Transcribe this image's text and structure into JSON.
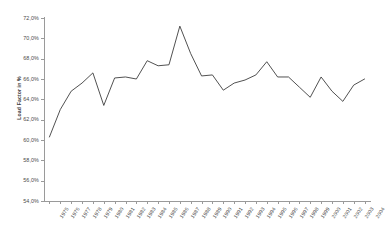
{
  "chart_data": {
    "type": "line",
    "title": "",
    "subtitle": "",
    "xlabel": "",
    "ylabel": "Load Factor in %",
    "ylim": [
      54.0,
      72.0
    ],
    "ytick_step": 2.0,
    "ytick_labels": [
      "72,0%",
      "70,0%",
      "68,0%",
      "66,0%",
      "64,0%",
      "62,0%",
      "60,0%",
      "58,0%",
      "56,0%",
      "54,0%"
    ],
    "ytick_values": [
      72.0,
      70.0,
      68.0,
      66.0,
      64.0,
      62.0,
      60.0,
      58.0,
      56.0,
      54.0
    ],
    "grid": false,
    "legend": false,
    "legend_position": "none",
    "line_color": "#3d3d3d",
    "axis_color": "#9a9a9a",
    "background_color": "#ffffff",
    "categories": [
      "1975",
      "1976",
      "1977",
      "1978",
      "1979",
      "1980",
      "1981",
      "1982",
      "1983",
      "1984",
      "1985",
      "1986",
      "1987",
      "1988",
      "1989",
      "1990",
      "1991",
      "1992",
      "1993",
      "1994",
      "1995",
      "1996",
      "1997",
      "1998",
      "1999",
      "2000",
      "2001",
      "2002",
      "2003",
      "2004"
    ],
    "values": [
      60.3,
      63.0,
      64.8,
      65.6,
      66.6,
      63.4,
      66.1,
      66.2,
      66.0,
      67.8,
      67.3,
      67.4,
      71.2,
      68.5,
      66.3,
      66.4,
      64.9,
      65.6,
      65.9,
      66.4,
      67.7,
      66.2,
      66.2,
      65.2,
      64.2,
      66.2,
      64.8,
      63.8,
      65.4,
      66.0
    ],
    "series": [
      {
        "name": "Load Factor",
        "values": [
          60.3,
          63.0,
          64.8,
          65.6,
          66.6,
          63.4,
          66.1,
          66.2,
          66.0,
          67.8,
          67.3,
          67.4,
          71.2,
          68.5,
          66.3,
          66.4,
          64.9,
          65.6,
          65.9,
          66.4,
          67.7,
          66.2,
          66.2,
          65.2,
          64.2,
          66.2,
          64.8,
          63.8,
          65.4,
          66.0
        ]
      }
    ]
  }
}
